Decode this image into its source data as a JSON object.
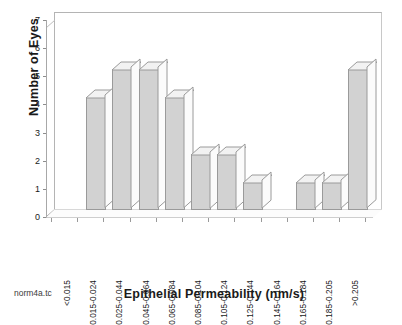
{
  "chart_data": {
    "type": "bar",
    "title": "",
    "subtitle": "",
    "xlabel": "Epithelial Permeability (nm/s)",
    "ylabel": "Number of Eyes",
    "categories": [
      "<0.015",
      "0.015-0.024",
      "0.025-0.044",
      "0.045-0.064",
      "0.065-0.084",
      "0.085-0.104",
      "0.105-0.124",
      "0.125-0.144",
      "0.145-0.164",
      "0.165-0.184",
      "0.185-0.205",
      ">0.205"
    ],
    "values": [
      0,
      4,
      5,
      5,
      4,
      2,
      2,
      1,
      0,
      1,
      1,
      5
    ],
    "ylim": [
      0,
      7
    ],
    "yticks": [
      0,
      1,
      2,
      3,
      4,
      5,
      6,
      7
    ],
    "ytick_labels": [
      "0",
      "1",
      "2",
      "3",
      "4",
      "5",
      "6",
      "7"
    ],
    "grid": false,
    "legend": false,
    "legend_position": "none",
    "style": "3d-bar",
    "bar_fill_color": "#d2d2d2",
    "bar_outline_color": "#9a9a9a",
    "bar_top_color": "#f2f2f2",
    "bar_side_color": "#fbfbfb",
    "axis_color": "#a8a8a8",
    "background_color": "#ffffff",
    "annotations": [
      {
        "name": "file-tag",
        "text": "norm4a.tc"
      }
    ]
  }
}
